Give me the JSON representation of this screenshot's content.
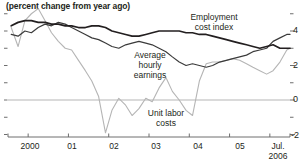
{
  "chart_data": {
    "type": "line",
    "title": "(percent change from year ago)",
    "subtitle": "",
    "xlabel": "",
    "ylabel": "",
    "ylim": [
      -2,
      5.4
    ],
    "xlim": [
      1999.5,
      2006.5
    ],
    "grid": false,
    "zero_line": true,
    "legend_position": "inline-annotations",
    "y_ticks_major": [
      "4",
      "2",
      "0",
      "-2"
    ],
    "y_tick_values_major": [
      4,
      2,
      0,
      -2
    ],
    "y_tick_values_minor": [
      5,
      3,
      1,
      -1
    ],
    "x_tick_labels": [
      "2000",
      "01",
      "02",
      "03",
      "04",
      "05",
      "Jul.",
      "2006"
    ],
    "x_tick_values": [
      2000,
      2001,
      2002,
      2003,
      2004,
      2005,
      2006
    ],
    "x_end_label_line1": "Jul.",
    "x_end_label_line2": "2006",
    "colors": {
      "employment_cost_index": "#231f20",
      "average_hourly_earnings": "#3b3b3b",
      "unit_labor_costs": "#b5b5b5",
      "axis": "#6e6e6e",
      "zero_line": "#b5b5b5",
      "text": "#231f20",
      "background": "#ffffff"
    },
    "series": [
      {
        "name": "Employment cost index",
        "label": "Employment\ncost index",
        "label_line1": "Employment",
        "label_line2": "cost index",
        "color": "#231f20",
        "x": [
          1999.58,
          1999.75,
          1999.92,
          2000.08,
          2000.25,
          2000.42,
          2000.58,
          2000.75,
          2000.92,
          2001.08,
          2001.25,
          2001.42,
          2001.58,
          2001.75,
          2001.92,
          2002.08,
          2002.25,
          2002.42,
          2002.58,
          2002.75,
          2002.92,
          2003.08,
          2003.25,
          2003.42,
          2003.58,
          2003.75,
          2003.92,
          2004.08,
          2004.25,
          2004.42,
          2004.58,
          2004.75,
          2004.92,
          2005.08,
          2005.25,
          2005.42,
          2005.58,
          2005.75,
          2005.92,
          2006.08,
          2006.25,
          2006.42,
          2006.5
        ],
        "y": [
          4.3,
          4.5,
          4.6,
          4.6,
          4.5,
          4.5,
          4.4,
          4.4,
          4.3,
          4.3,
          4.2,
          4.2,
          4.3,
          4.3,
          4.2,
          4.0,
          3.9,
          3.8,
          3.7,
          3.7,
          3.8,
          3.9,
          4.0,
          4.0,
          4.0,
          4.0,
          3.9,
          3.9,
          3.8,
          3.8,
          3.7,
          3.6,
          3.5,
          3.4,
          3.3,
          3.2,
          3.1,
          3.0,
          3.1,
          3.2,
          3.0,
          3.0,
          3.0
        ]
      },
      {
        "name": "Average hourly earnings",
        "label": "Average\nhourly\nearnings",
        "label_line1": "Average",
        "label_line2": "hourly",
        "label_line3": "earnings",
        "color": "#3b3b3b",
        "x": [
          1999.58,
          1999.75,
          1999.92,
          2000.08,
          2000.25,
          2000.42,
          2000.58,
          2000.75,
          2000.92,
          2001.08,
          2001.25,
          2001.42,
          2001.58,
          2001.75,
          2001.92,
          2002.08,
          2002.25,
          2002.42,
          2002.58,
          2002.75,
          2002.92,
          2003.08,
          2003.25,
          2003.42,
          2003.58,
          2003.75,
          2003.92,
          2004.08,
          2004.25,
          2004.42,
          2004.58,
          2004.75,
          2004.92,
          2005.08,
          2005.25,
          2005.42,
          2005.58,
          2005.75,
          2005.92,
          2006.08,
          2006.25,
          2006.42,
          2006.5
        ],
        "y": [
          3.8,
          3.7,
          4.0,
          3.9,
          4.2,
          4.4,
          4.3,
          4.5,
          4.4,
          4.2,
          4.0,
          3.8,
          3.6,
          3.5,
          3.3,
          3.1,
          3.0,
          3.2,
          3.3,
          3.4,
          3.3,
          3.2,
          3.0,
          2.8,
          2.5,
          2.2,
          2.0,
          2.1,
          2.0,
          1.9,
          2.0,
          2.2,
          2.3,
          2.4,
          2.5,
          2.6,
          2.8,
          2.9,
          3.0,
          3.4,
          3.6,
          3.8,
          3.8
        ]
      },
      {
        "name": "Unit labor costs",
        "label": "Unit labor\ncosts",
        "label_line1": "Unit labor",
        "label_line2": "costs",
        "color": "#b5b5b5",
        "x": [
          1999.58,
          1999.75,
          1999.92,
          2000.08,
          2000.25,
          2000.42,
          2000.58,
          2000.75,
          2000.92,
          2001.08,
          2001.25,
          2001.42,
          2001.58,
          2001.75,
          2001.92,
          2002.08,
          2002.25,
          2002.42,
          2002.58,
          2002.75,
          2002.92,
          2003.08,
          2003.25,
          2003.42,
          2003.58,
          2003.75,
          2003.92,
          2004.08,
          2004.25,
          2004.42,
          2004.58,
          2004.75,
          2004.92,
          2005.08,
          2005.25,
          2005.42,
          2005.58,
          2005.75,
          2005.92,
          2006.08,
          2006.25,
          2006.42,
          2006.5
        ],
        "y": [
          4.2,
          3.1,
          4.6,
          5.0,
          5.3,
          4.6,
          3.9,
          3.4,
          3.0,
          2.9,
          2.3,
          1.7,
          1.1,
          0.2,
          -1.9,
          -0.6,
          0.1,
          -0.3,
          -0.9,
          -0.5,
          0.1,
          -0.1,
          0.7,
          1.3,
          0.5,
          0.0,
          -0.6,
          -0.9,
          1.1,
          2.1,
          2.2,
          2.2,
          2.3,
          2.4,
          2.3,
          2.1,
          1.9,
          1.7,
          1.5,
          1.7,
          2.2,
          2.9,
          3.0
        ]
      }
    ]
  },
  "annotations": {
    "eci_label_x": 210,
    "ahe_label_x": 152,
    "ulc_label_x": 165
  }
}
